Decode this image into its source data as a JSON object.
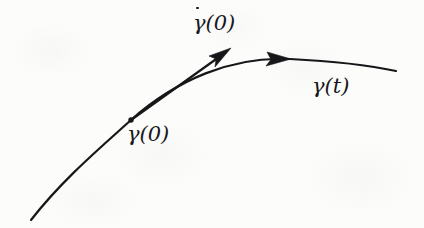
{
  "figure": {
    "name": "curve-with-tangent-vector-diagram",
    "background_color": "#fcfcfb",
    "ink_color": "#17171a",
    "width": 424,
    "height": 228
  },
  "labels": {
    "velocity_vector": {
      "symbol": "γ",
      "has_overdot": true,
      "argument": "(0)",
      "full_text": "γ̇(0)",
      "x": 193,
      "y": 13
    },
    "base_point": {
      "symbol": "γ",
      "has_overdot": false,
      "argument": "(0)",
      "full_text": "γ(0)",
      "x": 127,
      "y": 124
    },
    "curve": {
      "symbol": "γ",
      "has_overdot": false,
      "argument": "(t)",
      "full_text": "γ(t)",
      "x": 312,
      "y": 76
    }
  },
  "geometry": {
    "curve": {
      "name": "gamma-curve",
      "path": "M 31 220 C 62 180, 100 148, 131 120 C 176 80, 232 56, 290 59 C 330 61, 368 65, 396 71",
      "stroke_width": 2.2
    },
    "curve_direction_arrow": {
      "name": "curve-direction-arrowhead",
      "tip_x": 291,
      "tip_y": 59,
      "angle_deg": -4
    },
    "tangent_vector": {
      "name": "tangent-vector-arrow",
      "start_x": 131,
      "start_y": 120,
      "tip_x": 231,
      "tip_y": 48,
      "stroke_width": 2.2
    },
    "base_point_marker": {
      "name": "base-point-dot",
      "x": 131,
      "y": 120,
      "radius": 2.6
    }
  }
}
